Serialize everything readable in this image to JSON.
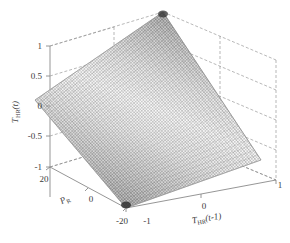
{
  "figure": {
    "kind": "3d-mesh-surface-plot",
    "background_color": "#ffffff",
    "axis_line_color": "#8a8a8a",
    "grid_line_color": "#9a9a9a",
    "grid_style": "dashed",
    "mesh_color_dark": "#4a4a4a",
    "mesh_color_light": "#e8e8e8"
  },
  "axes": {
    "z": {
      "title_main": "T",
      "title_sub": "HR",
      "title_arg": "(t)",
      "ticks": [
        "1",
        "0.5",
        "0",
        "-0.5",
        "-1"
      ],
      "tick_values": [
        1,
        0.5,
        0,
        -0.5,
        -1
      ],
      "lim": [
        -1,
        1
      ]
    },
    "y": {
      "title_main": "P",
      "title_sub": "R",
      "title_arg": "",
      "ticks": [
        "20",
        "0",
        "-20"
      ],
      "tick_values": [
        20,
        0,
        -20
      ],
      "lim": [
        -20,
        20
      ]
    },
    "x": {
      "title_main": "T",
      "title_sub": "HR",
      "title_arg": "(t-1)",
      "ticks": [
        "-1",
        "0",
        "1"
      ],
      "tick_values": [
        -1,
        0,
        1
      ],
      "lim": [
        -1,
        1
      ]
    }
  },
  "chart_data": {
    "type": "surface",
    "title": "",
    "xlabel": "T_HR(t-1)",
    "ylabel": "P_R",
    "zlabel": "T_HR(t)",
    "xlim": [
      -1,
      1
    ],
    "ylim": [
      -20,
      20
    ],
    "zlim": [
      -1,
      1
    ],
    "xticks": [
      -1,
      0,
      1
    ],
    "yticks": [
      -20,
      0,
      20
    ],
    "zticks": [
      -1,
      -0.5,
      0,
      0.5,
      1
    ],
    "grid": true,
    "legend": null,
    "colormap": "grayscale",
    "shading": "mesh-wireframe",
    "grid_resolution": [
      31,
      31
    ],
    "surface_formula": "z = tanh(0.5*(P_R/20) + 0.5*T_HR(t-1)) scaled to [-1,1]",
    "corner_values": {
      "x_min_y_min": -1.0,
      "x_max_y_min": 0.0,
      "x_min_y_max": 0.0,
      "x_max_y_max": 1.0
    },
    "samples": [
      {
        "x": -1,
        "y": -20,
        "z": -1.0
      },
      {
        "x": -0.5,
        "y": -20,
        "z": -0.78
      },
      {
        "x": 0,
        "y": -20,
        "z": -0.55
      },
      {
        "x": 0.5,
        "y": -20,
        "z": -0.29
      },
      {
        "x": 1,
        "y": -20,
        "z": 0.0
      },
      {
        "x": -1,
        "y": -10,
        "z": -0.78
      },
      {
        "x": -0.5,
        "y": -10,
        "z": -0.55
      },
      {
        "x": 0,
        "y": -10,
        "z": -0.29
      },
      {
        "x": 0.5,
        "y": -10,
        "z": 0.0
      },
      {
        "x": 1,
        "y": -10,
        "z": 0.29
      },
      {
        "x": -1,
        "y": 0,
        "z": -0.55
      },
      {
        "x": -0.5,
        "y": 0,
        "z": -0.29
      },
      {
        "x": 0,
        "y": 0,
        "z": 0.0
      },
      {
        "x": 0.5,
        "y": 0,
        "z": 0.29
      },
      {
        "x": 1,
        "y": 0,
        "z": 0.55
      },
      {
        "x": -1,
        "y": 10,
        "z": -0.29
      },
      {
        "x": -0.5,
        "y": 10,
        "z": 0.0
      },
      {
        "x": 0,
        "y": 10,
        "z": 0.29
      },
      {
        "x": 0.5,
        "y": 10,
        "z": 0.55
      },
      {
        "x": 1,
        "y": 10,
        "z": 0.78
      },
      {
        "x": -1,
        "y": 20,
        "z": 0.0
      },
      {
        "x": -0.5,
        "y": 20,
        "z": 0.29
      },
      {
        "x": 0,
        "y": 20,
        "z": 0.55
      },
      {
        "x": 0.5,
        "y": 20,
        "z": 0.78
      },
      {
        "x": 1,
        "y": 20,
        "z": 1.0
      }
    ]
  }
}
